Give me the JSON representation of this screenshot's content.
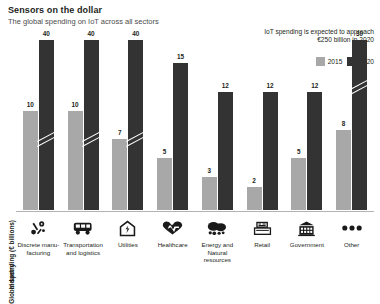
{
  "header": {
    "title": "Sensors on the dollar",
    "subtitle": "The global spending on IoT across all sectors"
  },
  "annotation": "IoT spending is expected to approach €250 billion in 2020",
  "legend": {
    "position": "top-right",
    "items": [
      {
        "label": "2015",
        "color": "#a8a8a8"
      },
      {
        "label": "2020",
        "color": "#333333"
      }
    ]
  },
  "axes": {
    "ylabel": "Global spending (€ billions)",
    "xlabel": "Industry"
  },
  "icons": [
    "tools-icon",
    "bus-icon",
    "house-bolt-icon",
    "heartbeat-icon",
    "nature-icon",
    "cash-register-icon",
    "government-building-icon",
    "ellipsis-icon"
  ],
  "chart_data": {
    "type": "bar",
    "title": "Sensors on the dollar",
    "subtitle": "The global spending on IoT across all sectors",
    "xlabel": "Industry",
    "ylabel": "Global spending (€ billions)",
    "ylim": [
      0,
      42
    ],
    "grid": false,
    "legend_position": "top-right",
    "note": "Bars for Discrete manufacturing, Transportation and logistics, Utilities and Other are truncated with axis-break marks",
    "categories": [
      "Discrete manu-facturing",
      "Transportation and logistics",
      "Utilities",
      "Healthcare",
      "Energy and Natural resources",
      "Retail",
      "Government",
      "Other"
    ],
    "series": [
      {
        "name": "2015",
        "color": "#a8a8a8",
        "values": [
          10,
          10,
          7,
          5,
          3,
          2,
          5,
          8
        ]
      },
      {
        "name": "2020",
        "color": "#333333",
        "values": [
          40,
          40,
          40,
          15,
          12,
          12,
          12,
          30
        ]
      }
    ]
  }
}
